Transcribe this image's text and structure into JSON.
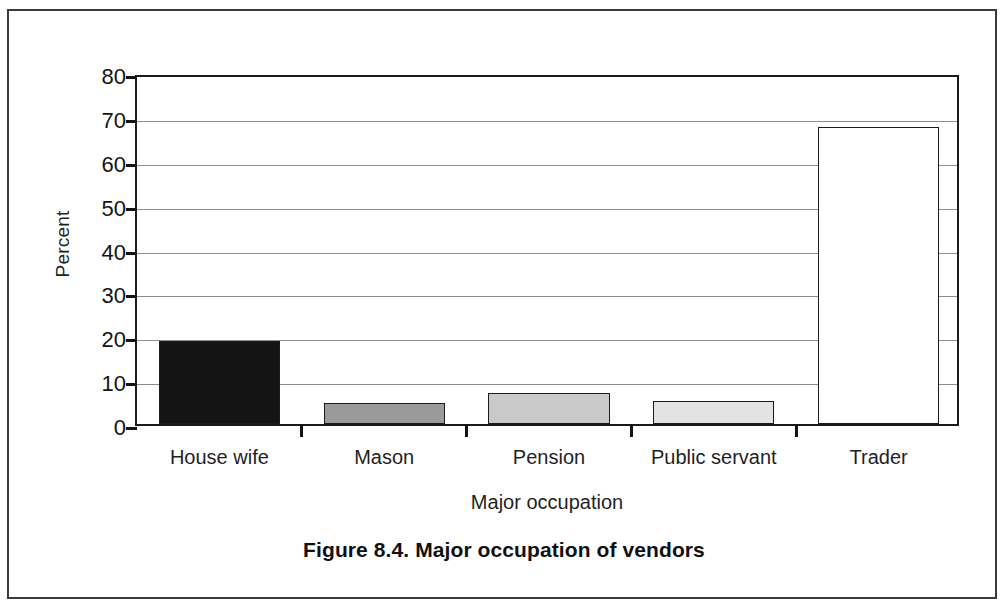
{
  "figure": {
    "caption": "Figure 8.4. Major occupation of vendors"
  },
  "chart_data": {
    "type": "bar",
    "title": "Figure 8.4. Major occupation of vendors",
    "subtitle": "",
    "xlabel": "Major occupation",
    "ylabel": "Percent",
    "categories": [
      "House wife",
      "Mason",
      "Pension",
      "Public servant",
      "Trader"
    ],
    "values": [
      19.0,
      4.7,
      7.1,
      5.2,
      67.6
    ],
    "series": [
      {
        "name": "Percent",
        "values": [
          19.0,
          4.7,
          7.1,
          5.2,
          67.6
        ]
      }
    ],
    "bar_colors": [
      "#141414",
      "#9a9a9a",
      "#c9c9c9",
      "#e3e3e3",
      "#ffffff"
    ],
    "bar_edge_color": "#1b1b1b",
    "ylim": [
      0,
      80
    ],
    "ytick_labels": [
      "80",
      "70",
      "60",
      "50",
      "40",
      "30",
      "20",
      "10",
      "0"
    ],
    "ytick_values": [
      80,
      70,
      60,
      50,
      40,
      30,
      20,
      10,
      0
    ],
    "ystep": 10,
    "grid": "horizontal",
    "legend": "none",
    "axis_color": "#1b1b1b",
    "gridline_color": "#8d8d8d",
    "background": "#ffffff"
  }
}
